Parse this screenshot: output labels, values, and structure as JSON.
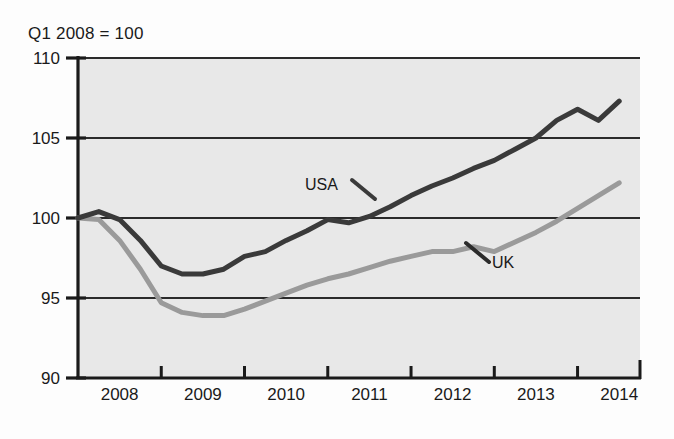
{
  "chart_data": {
    "type": "line",
    "title": "Q1 2008 = 100",
    "subtitle": "",
    "xlabel": "",
    "ylabel": "",
    "ylim": [
      90,
      110
    ],
    "xlim": [
      2008,
      2014.75
    ],
    "yticks": [
      90,
      95,
      100,
      105,
      110
    ],
    "xticks": [
      2008,
      2009,
      2010,
      2011,
      2012,
      2013,
      2014
    ],
    "xtick_labels": [
      "2008",
      "2009",
      "2010",
      "2011",
      "2012",
      "2013",
      "2014"
    ],
    "ytick_labels": [
      "110",
      "105",
      "100",
      "95",
      "90"
    ],
    "grid": "horizontal",
    "legend_position": "inline-annotation",
    "plot_background": "#e8e8e8",
    "x": [
      2008.0,
      2008.25,
      2008.5,
      2008.75,
      2009.0,
      2009.25,
      2009.5,
      2009.75,
      2010.0,
      2010.25,
      2010.5,
      2010.75,
      2011.0,
      2011.25,
      2011.5,
      2011.75,
      2012.0,
      2012.25,
      2012.5,
      2012.75,
      2013.0,
      2013.25,
      2013.5,
      2013.75,
      2014.0,
      2014.25,
      2014.5
    ],
    "series": [
      {
        "name": "USA",
        "color": "#3a3a3a",
        "label": "USA",
        "values": [
          100.0,
          100.4,
          99.9,
          98.6,
          97.0,
          96.5,
          96.5,
          96.8,
          97.6,
          97.9,
          98.6,
          99.2,
          99.9,
          99.7,
          100.1,
          100.7,
          101.4,
          102.0,
          102.5,
          103.1,
          103.6,
          104.3,
          105.0,
          106.1,
          106.8,
          106.1,
          107.3
        ]
      },
      {
        "name": "UK",
        "color": "#9a9a9a",
        "label": "UK",
        "values": [
          100.0,
          99.9,
          98.6,
          96.8,
          94.7,
          94.1,
          93.9,
          93.9,
          94.3,
          94.8,
          95.3,
          95.8,
          96.2,
          96.5,
          96.9,
          97.3,
          97.6,
          97.9,
          97.9,
          98.2,
          97.9,
          98.5,
          99.1,
          99.8,
          100.6,
          101.4,
          102.2
        ]
      }
    ],
    "annotations": [
      {
        "text": "USA",
        "series": "USA",
        "x": 2010.6,
        "y": 102.2
      },
      {
        "text": "UK",
        "series": "UK",
        "x": 2012.5,
        "y": 97.6
      }
    ]
  }
}
